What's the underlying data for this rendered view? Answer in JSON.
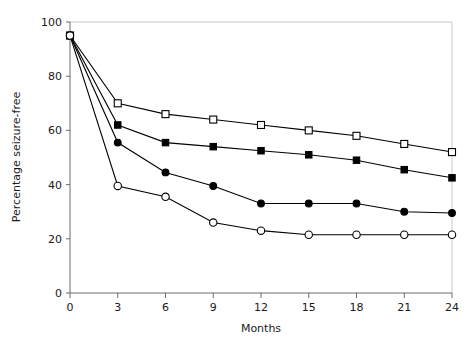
{
  "chart_data": {
    "type": "line",
    "title": "",
    "xlabel": "Months",
    "ylabel": "Percentage seizure-free",
    "x": [
      0,
      3,
      6,
      9,
      12,
      15,
      18,
      21,
      24
    ],
    "xticks": [
      "0",
      "3",
      "6",
      "9",
      "12",
      "15",
      "18",
      "21",
      "24"
    ],
    "yticks": [
      "0",
      "20",
      "40",
      "60",
      "80",
      "100"
    ],
    "xlim": [
      0,
      24
    ],
    "ylim": [
      0,
      100
    ],
    "grid": false,
    "legend": "none",
    "series": [
      {
        "name": "open-square",
        "marker": "open-square",
        "color": "#000000",
        "values": [
          95,
          70,
          66,
          64,
          62,
          60,
          58,
          55,
          52
        ]
      },
      {
        "name": "filled-square",
        "marker": "filled-square",
        "color": "#000000",
        "values": [
          95,
          62,
          55.5,
          54,
          52.5,
          51,
          49,
          45.5,
          42.5
        ]
      },
      {
        "name": "filled-circle",
        "marker": "filled-circle",
        "color": "#000000",
        "values": [
          95,
          55.5,
          44.5,
          39.5,
          33,
          33,
          33,
          30,
          29.5
        ]
      },
      {
        "name": "open-circle",
        "marker": "open-circle",
        "color": "#000000",
        "values": [
          95,
          39.5,
          35.5,
          26,
          23,
          21.5,
          21.5,
          21.5,
          21.5
        ]
      }
    ]
  },
  "axes": {
    "x_title": "Months",
    "y_title": "Percentage seizure-free"
  }
}
